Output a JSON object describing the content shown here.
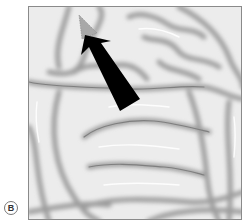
{
  "figure": {
    "panel_label": "B",
    "colors": {
      "background": "#ececec",
      "sulcus_shadow": "#9a9a9a",
      "frame_border": "#8a8a8a",
      "arrow_body": "#000000",
      "arrow_tip": "#a8a8a8"
    },
    "arrow": {
      "tip": [
        78,
        14
      ],
      "base_left": [
        119,
        110
      ],
      "base_right": [
        139,
        98
      ]
    }
  }
}
